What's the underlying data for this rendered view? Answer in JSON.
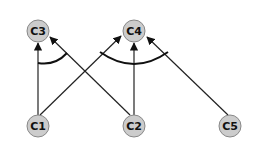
{
  "diagram": {
    "nodes": [
      {
        "id": "C3",
        "label": "C3",
        "x": 38,
        "y": 31
      },
      {
        "id": "C4",
        "label": "C4",
        "x": 134,
        "y": 31
      },
      {
        "id": "C1",
        "label": "C1",
        "x": 38,
        "y": 126
      },
      {
        "id": "C2",
        "label": "C2",
        "x": 134,
        "y": 126
      },
      {
        "id": "C5",
        "label": "C5",
        "x": 230,
        "y": 126
      }
    ],
    "edges": [
      {
        "from": "C1",
        "to": "C3"
      },
      {
        "from": "C2",
        "to": "C3"
      },
      {
        "from": "C1",
        "to": "C4"
      },
      {
        "from": "C2",
        "to": "C4"
      },
      {
        "from": "C5",
        "to": "C4"
      }
    ],
    "and_arcs": [
      {
        "target": "C3",
        "edges": [
          "C1->C3",
          "C2->C3"
        ]
      },
      {
        "target": "C4",
        "edges": [
          "C1->C4",
          "C2->C4",
          "C5->C4"
        ]
      }
    ],
    "colors": {
      "node_fill": "#cccccc",
      "node_stroke": "#888888",
      "edge": "#222222"
    }
  }
}
